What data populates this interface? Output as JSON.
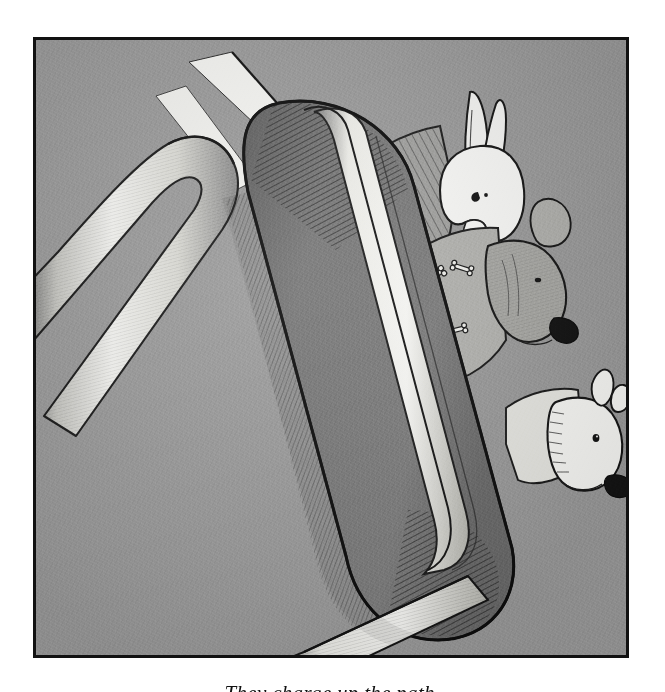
{
  "page": {
    "background_color": "#ffffff",
    "width": 665,
    "height": 692
  },
  "plate": {
    "type": "pen-and-ink illustration",
    "frame_color": "#111111",
    "frame_thickness_px": 3,
    "background_color": "#9b9b9b",
    "secondary_gray": "#757575",
    "highlight_color": "#f5f5f2",
    "ink_color": "#1a1a1a",
    "title": "Three animals peeking over a toboggan",
    "alt_text": "A large elongated sled tilts diagonally across a gray field; a long-eared rabbit and two bull-terrier dogs peer out from behind it, and a curved white handrail rises at the left."
  },
  "subjects": [
    {
      "id": "rabbit",
      "label": "Rabbit",
      "description": "White long-eared rabbit head with two upright ears, dark dot eye and whiskered muzzle, wearing a dark hatched striped garment.",
      "position": "upper right"
    },
    {
      "id": "dog-bone-sweater",
      "label": "Dog in bone-print sweater",
      "description": "Bull terrier head in profile with folded ear, dark nose and hatched shading, wearing a garment printed with scattered bones.",
      "position": "middle right"
    },
    {
      "id": "dog-white",
      "label": "White dog",
      "description": "White bull terrier head in profile with pointed ear, round eye and dark nose, body hidden behind the sled.",
      "position": "lower right"
    }
  ],
  "objects": [
    {
      "id": "toboggan",
      "label": "Toboggan",
      "description": "Large elongated rounded-end sled running diagonally from upper left to lower right, with a pale runner stripe down its centre and dense crosshatch shading along its curved ends."
    },
    {
      "id": "handrail",
      "label": "Curved handrail",
      "description": "White tubular bar that rises in an arc at the left of the plate and descends toward the lower left corner."
    },
    {
      "id": "stripe-upper",
      "label": "Upper white bar",
      "description": "Narrow white diagonal bar at the top of the plate."
    },
    {
      "id": "stripe-lower",
      "label": "Lower white bar",
      "description": "Second narrow white diagonal bar beneath the first."
    },
    {
      "id": "runner",
      "label": "Sled runner",
      "description": "Long white runner strip crossing the lower part of the plate to the bottom frame edge."
    }
  ],
  "caption": {
    "text": "They charge up the path.",
    "note": "clipped by the bottom edge of the screenshot"
  }
}
